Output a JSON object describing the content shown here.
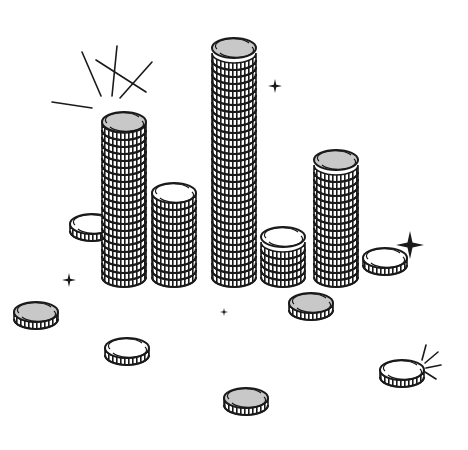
{
  "illustration": {
    "subject": "coin stacks of varying height with loose coins and sparkles",
    "colors": {
      "background": "#ffffff",
      "stroke": "#1a1a1a",
      "coin_face_gray": "#c8c8c8",
      "coin_face_white": "#ffffff"
    },
    "stacks": [
      {
        "cx": 124,
        "top": 122,
        "bottom": 270,
        "face": "gray"
      },
      {
        "cx": 174,
        "top": 193,
        "bottom": 270,
        "face": "white"
      },
      {
        "cx": 234,
        "top": 48,
        "bottom": 270,
        "face": "gray"
      },
      {
        "cx": 283,
        "top": 237,
        "bottom": 270,
        "face": "white"
      },
      {
        "cx": 336,
        "top": 160,
        "bottom": 270,
        "face": "gray"
      }
    ],
    "loose_coins": [
      {
        "cx": 92,
        "cy": 224,
        "face": "white"
      },
      {
        "cx": 385,
        "cy": 258,
        "face": "white"
      },
      {
        "cx": 36,
        "cy": 312,
        "face": "gray"
      },
      {
        "cx": 127,
        "cy": 348,
        "face": "white"
      },
      {
        "cx": 311,
        "cy": 303,
        "face": "gray"
      },
      {
        "cx": 246,
        "cy": 398,
        "face": "gray"
      },
      {
        "cx": 402,
        "cy": 370,
        "face": "white"
      }
    ],
    "sparkles": [
      {
        "x": 275,
        "y": 86,
        "size": 7
      },
      {
        "x": 410,
        "y": 245,
        "size": 14
      },
      {
        "x": 69,
        "y": 280,
        "size": 7
      },
      {
        "x": 224,
        "y": 312,
        "size": 4
      }
    ],
    "shine_bursts": [
      {
        "label": "burst-top-left",
        "lines": [
          [
            146,
            92,
            96,
            60
          ],
          [
            101,
            96,
            82,
            52
          ],
          [
            112,
            96,
            117,
            46
          ],
          [
            120,
            98,
            152,
            62
          ],
          [
            92,
            108,
            52,
            102
          ]
        ]
      },
      {
        "label": "burst-small-right",
        "lines": [
          [
            422,
            360,
            426,
            345
          ],
          [
            425,
            363,
            438,
            352
          ],
          [
            426,
            368,
            441,
            365
          ],
          [
            425,
            372,
            436,
            379
          ]
        ]
      }
    ]
  }
}
